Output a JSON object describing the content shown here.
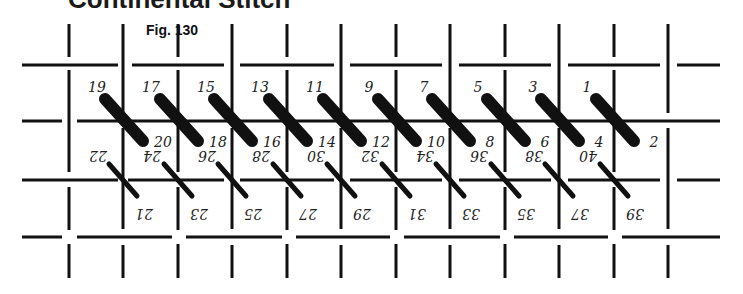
{
  "heading": "Continental Stitch",
  "figure_label": "Fig. 130",
  "colors": {
    "ink": "#111111",
    "background": "#ffffff"
  },
  "grid": {
    "rows_y": [
      65,
      121,
      180,
      237
    ],
    "cols_x": [
      69,
      123,
      178,
      232,
      287,
      341,
      396,
      450,
      505,
      559,
      614,
      668
    ]
  },
  "stitches": {
    "front_row_thick": {
      "count": 10,
      "description": "Long diagonal thick stitches crossing the upper horizontal thread"
    },
    "back_row_thin": {
      "count": 10,
      "description": "Thin diagonal stitches crossing the lower horizontal thread"
    }
  },
  "numbers": {
    "top_row_odd": [
      "19",
      "17",
      "15",
      "13",
      "11",
      "9",
      "7",
      "5",
      "3",
      "1"
    ],
    "second_row_even": [
      "20",
      "18",
      "16",
      "14",
      "12",
      "10",
      "8",
      "6",
      "4",
      "2"
    ],
    "third_row_inverted_even": [
      "22",
      "24",
      "26",
      "28",
      "30",
      "32",
      "34",
      "36",
      "38",
      "40"
    ],
    "bottom_row_inverted_odd": [
      "21",
      "23",
      "25",
      "27",
      "29",
      "31",
      "33",
      "35",
      "37",
      "39"
    ]
  }
}
